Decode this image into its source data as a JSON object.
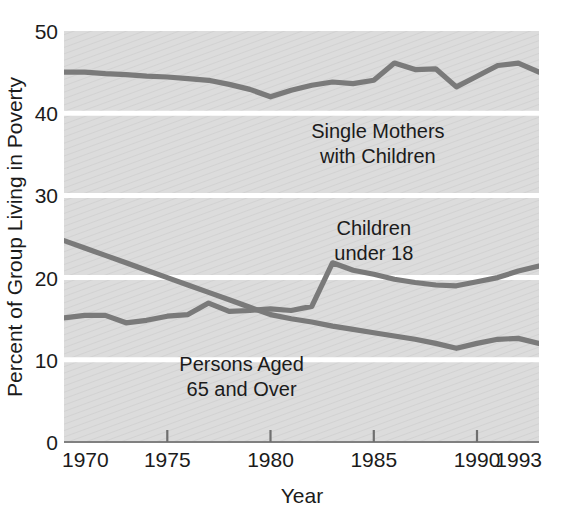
{
  "chart_data": {
    "type": "line",
    "title": "",
    "xlabel": "Year",
    "ylabel": "Percent of Group Living in Poverty",
    "xlim": [
      1970,
      1993
    ],
    "ylim": [
      0,
      50
    ],
    "yticks": [
      0,
      10,
      20,
      30,
      40,
      50
    ],
    "ytick_labels": [
      "0",
      "10",
      "20",
      "30",
      "40",
      "50"
    ],
    "xticks": [
      1970,
      1975,
      1980,
      1985,
      1990,
      1993
    ],
    "xtick_labels": [
      "1970",
      "1975",
      "1980",
      "1985",
      "1990",
      "1993"
    ],
    "grid": "horizontal-white-gridlines",
    "plot_background": "#d9d9d9",
    "line_color": "#7a7a7a",
    "legend": "inline-labels",
    "x": [
      1970,
      1971,
      1972,
      1973,
      1974,
      1975,
      1976,
      1977,
      1978,
      1979,
      1980,
      1981,
      1982,
      1983,
      1984,
      1985,
      1986,
      1987,
      1988,
      1989,
      1990,
      1991,
      1992,
      1993
    ],
    "series": [
      {
        "name": "Single Mothers with Children",
        "label_lines": [
          "Single Mothers",
          "with Children"
        ],
        "label_x": 1985.2,
        "label_y": 37.0,
        "values": [
          45.0,
          45.0,
          44.8,
          44.7,
          44.5,
          44.4,
          44.2,
          44.0,
          43.5,
          42.9,
          42.0,
          42.8,
          43.4,
          43.8,
          43.6,
          44.0,
          46.1,
          45.3,
          45.4,
          43.2,
          44.5,
          45.8,
          46.1,
          45.0
        ]
      },
      {
        "name": "Children under 18",
        "label_lines": [
          "Children",
          "under 18"
        ],
        "label_x": 1985.0,
        "label_y": 25.2,
        "values": [
          15.1,
          15.4,
          15.4,
          14.5,
          14.8,
          15.3,
          15.5,
          16.9,
          15.9,
          16.0,
          16.2,
          16.0,
          16.5,
          21.8,
          20.9,
          20.4,
          19.8,
          19.4,
          19.1,
          19.0,
          19.5,
          20.0,
          20.8,
          21.4
        ]
      },
      {
        "name": "Persons Aged 65 and Over",
        "label_lines": [
          "Persons Aged",
          "65 and Over"
        ],
        "label_x": 1978.6,
        "label_y": 8.6,
        "values": [
          24.5,
          23.6,
          22.7,
          21.8,
          20.9,
          20.0,
          19.1,
          18.2,
          17.3,
          16.4,
          15.5,
          15.0,
          14.6,
          14.1,
          13.7,
          13.3,
          12.9,
          12.5,
          12.0,
          11.4,
          12.0,
          12.5,
          12.6,
          12.0
        ]
      }
    ]
  },
  "axes": {
    "y_title": "Percent of Group Living in Poverty",
    "x_title": "Year"
  }
}
